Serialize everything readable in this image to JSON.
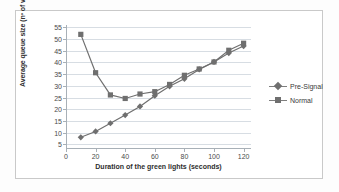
{
  "chart_data": {
    "type": "line",
    "title": "",
    "xlabel": "Duration of the green lights (seconds)",
    "ylabel": "Average queue size (nº of vehicles)",
    "x": [
      10,
      20,
      30,
      40,
      50,
      60,
      70,
      80,
      90,
      100,
      110,
      120
    ],
    "xlim": [
      0,
      125
    ],
    "ylim": [
      3,
      56
    ],
    "xticks": [
      0,
      20,
      40,
      60,
      80,
      100,
      120
    ],
    "yticks": [
      5,
      10,
      15,
      20,
      25,
      30,
      35,
      40,
      45,
      50,
      55
    ],
    "grid": true,
    "legend_position": "right",
    "series": [
      {
        "name": "Pre-Signal",
        "marker": "diamond",
        "color": "#6f6f6f",
        "values": [
          8.0,
          10.5,
          14.0,
          17.5,
          21.2,
          25.8,
          29.8,
          33.0,
          37.0,
          40.2,
          44.0,
          47.0
        ]
      },
      {
        "name": "Normal",
        "marker": "square",
        "color": "#6f6f6f",
        "values": [
          52.0,
          35.6,
          26.1,
          24.6,
          26.5,
          27.5,
          30.6,
          34.5,
          37.2,
          40.2,
          45.2,
          48.2
        ]
      }
    ]
  },
  "axis": {
    "xticklabels": [
      "0",
      "20",
      "40",
      "60",
      "80",
      "100",
      "120"
    ],
    "yticklabels": [
      "5",
      "10",
      "15",
      "20",
      "25",
      "30",
      "35",
      "40",
      "45",
      "50",
      "55"
    ]
  },
  "legend": {
    "items": [
      {
        "label": "Pre-Signal"
      },
      {
        "label": "Normal"
      }
    ]
  },
  "colors": {
    "series": "#6f6f6f",
    "gridline": "#d7dde3",
    "axis": "#a8b0b7",
    "text": "#3a3a3a",
    "frame": "#c9c9c9",
    "background": "#ffffff"
  }
}
